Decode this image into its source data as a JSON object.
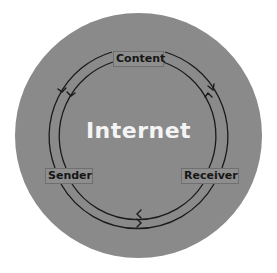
{
  "diagram": {
    "title": "Internet",
    "nodes": [
      {
        "id": "content",
        "label": "Content"
      },
      {
        "id": "sender",
        "label": "Sender"
      },
      {
        "id": "receiver",
        "label": "Receiver"
      }
    ],
    "flows": [
      {
        "from": "sender",
        "to": "content",
        "ring": "outer",
        "direction": "clockwise"
      },
      {
        "from": "content",
        "to": "receiver",
        "ring": "outer",
        "direction": "clockwise"
      },
      {
        "from": "receiver",
        "to": "sender",
        "ring": "outer",
        "direction": "clockwise"
      },
      {
        "from": "content",
        "to": "sender",
        "ring": "inner",
        "direction": "counter-clockwise"
      },
      {
        "from": "receiver",
        "to": "content",
        "ring": "inner",
        "direction": "counter-clockwise"
      },
      {
        "from": "sender",
        "to": "receiver",
        "ring": "inner",
        "direction": "counter-clockwise"
      }
    ],
    "colors": {
      "background": "#ffffff",
      "circle": "#8a8a8a",
      "title_text": "#f4f4f4",
      "label_text": "#161616",
      "ring_line": "#1a1a1a"
    }
  }
}
